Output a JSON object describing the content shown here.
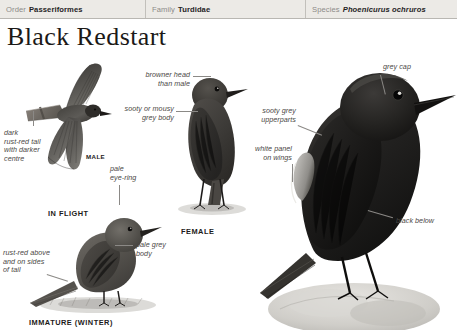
{
  "taxonomy": {
    "order": {
      "rank": "Order",
      "name": "Passeriformes"
    },
    "family": {
      "rank": "Family",
      "name": "Turdidae"
    },
    "species": {
      "rank": "Species",
      "name": "Phoenicurus ochruros"
    }
  },
  "title": "Black Redstart",
  "captions": {
    "male": "MALE",
    "in_flight": "IN FLIGHT",
    "female": "FEMALE",
    "immature_winter": "IMMATURE (WINTER)"
  },
  "annotations": {
    "dark_rust_red_tail": "dark\nrust-red tail\nwith darker\ncentre",
    "pale_eye_ring": "pale\neye-ring",
    "rust_red_above": "rust-red above\nand on sides\nof tail",
    "pale_grey_body": "pale grey\nbody",
    "browner_head": "browner head\nthan male",
    "sooty_or_mousy": "sooty or mousy\ngrey body",
    "grey_cap": "grey cap",
    "sooty_grey_upperparts": "sooty grey\nupperparts",
    "white_panel_on_wings": "white panel\non wings",
    "black_below": "black below"
  },
  "colors": {
    "header_bg": "#eceae6",
    "header_rule": "#b9b7b2",
    "rank_text": "#8d8b88",
    "name_text": "#25231f",
    "title_text": "#1b1917",
    "anno_text": "#4a4845",
    "leader_line": "#8b8986",
    "bird_dark": "#2a2826",
    "bird_mid": "#5b5956",
    "bird_light": "#8e8c88",
    "page_bg": "#ffffff"
  }
}
